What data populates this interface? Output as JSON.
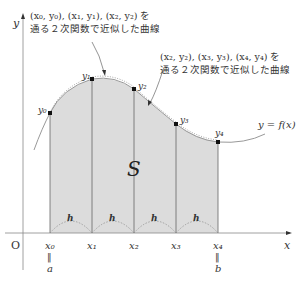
{
  "annotation_left": {
    "line1": "(x₀, y₀), (x₁, y₁), (x₂, y₂) を",
    "line2": "通る２次関数で近似した曲線"
  },
  "annotation_right": {
    "line1": "(x₂, y₂), (x₃, y₃), (x₄, y₄) を",
    "line2": "通る２次関数で近似した曲線"
  },
  "axes": {
    "x_label": "x",
    "y_label": "y",
    "origin": "O"
  },
  "curve_label": "y = f(x)",
  "area_label": "S",
  "points": [
    {
      "label": "y₀",
      "x": 50,
      "y": 113
    },
    {
      "label": "y₁",
      "x": 92,
      "y": 79
    },
    {
      "label": "y₂",
      "x": 134,
      "y": 89
    },
    {
      "label": "y₃",
      "x": 176,
      "y": 124
    },
    {
      "label": "y₄",
      "x": 218,
      "y": 142
    }
  ],
  "x_ticks": [
    "x₀",
    "x₁",
    "x₂",
    "x₃",
    "x₄"
  ],
  "interval_label": "h",
  "a_label": "a",
  "b_label": "b",
  "equals_mark": "‖",
  "colors": {
    "fill": "#dcdcdc",
    "curve": "#999999",
    "line": "#555555",
    "point": "#111111"
  }
}
